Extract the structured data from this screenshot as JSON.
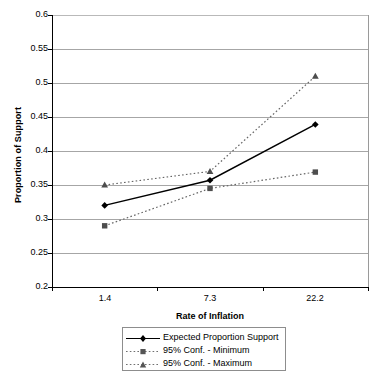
{
  "chart_data": {
    "type": "line",
    "title": "",
    "xlabel": "Rate of Inflation",
    "ylabel": "Proportion of Support",
    "categories": [
      "1.4",
      "7.3",
      "22.2"
    ],
    "ylim": [
      0.2,
      0.6
    ],
    "y_ticks": [
      "0.2",
      "0.25",
      "0.3",
      "0.35",
      "0.4",
      "0.45",
      "0.5",
      "0.55",
      "0.6"
    ],
    "y_tick_values": [
      0.2,
      0.25,
      0.3,
      0.35,
      0.4,
      0.45,
      0.5,
      0.55,
      0.6
    ],
    "grid": true,
    "legend_position": "bottom",
    "series": [
      {
        "name": "Expected Proportion Support",
        "values": [
          0.32,
          0.357,
          0.439
        ],
        "marker": "diamond",
        "line_style": "solid",
        "color": "#000000"
      },
      {
        "name": "95% Conf. - Minimum",
        "values": [
          0.29,
          0.345,
          0.369
        ],
        "marker": "square",
        "line_style": "dotted",
        "color": "#666666"
      },
      {
        "name": "95% Conf. - Maximum",
        "values": [
          0.35,
          0.37,
          0.51
        ],
        "marker": "triangle",
        "line_style": "dotted",
        "color": "#666666"
      }
    ]
  },
  "axes": {
    "y_title": "Proportion of Support",
    "x_title": "Rate of Inflation"
  },
  "legend": {
    "items": [
      {
        "label": "Expected Proportion Support"
      },
      {
        "label": "95% Conf. - Minimum"
      },
      {
        "label": "95% Conf. - Maximum"
      }
    ]
  }
}
